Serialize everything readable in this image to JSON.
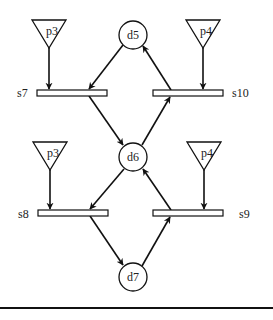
{
  "diagram": {
    "type": "petri-net",
    "places": [
      {
        "id": "d5",
        "label": "d5",
        "cx": 133,
        "cy": 35,
        "r": 14
      },
      {
        "id": "d6",
        "label": "d6",
        "cx": 133,
        "cy": 157,
        "r": 14
      },
      {
        "id": "d7",
        "label": "d7",
        "cx": 133,
        "cy": 277,
        "r": 14
      }
    ],
    "transitions": [
      {
        "id": "s7",
        "label": "s7",
        "x": 37,
        "y": 90,
        "w": 70,
        "h": 6,
        "label_x": 17,
        "label_y": 97
      },
      {
        "id": "s10",
        "label": "s10",
        "x": 153,
        "y": 90,
        "w": 70,
        "h": 6,
        "label_x": 232,
        "label_y": 97
      },
      {
        "id": "s8",
        "label": "s8",
        "x": 38,
        "y": 210,
        "w": 70,
        "h": 6,
        "label_x": 18,
        "label_y": 218
      },
      {
        "id": "s9",
        "label": "s9",
        "x": 153,
        "y": 210,
        "w": 70,
        "h": 6,
        "label_x": 239,
        "label_y": 218
      }
    ],
    "sources": [
      {
        "id": "p3-top",
        "label": "p3",
        "points": "32,20 66,20 49,48",
        "label_x": 52,
        "label_y": 31
      },
      {
        "id": "p4-top",
        "label": "p4",
        "points": "186,20 220,20 203,48",
        "label_x": 206,
        "label_y": 31
      },
      {
        "id": "p3-bottom",
        "label": "p3",
        "points": "33,142 67,142 50,170",
        "label_x": 53,
        "label_y": 153
      },
      {
        "id": "p4-bottom",
        "label": "p4",
        "points": "187,142 221,142 204,170",
        "label_x": 207,
        "label_y": 153
      }
    ],
    "arcs": [
      {
        "from": "p3-top",
        "to": "s7",
        "x1": 49,
        "y1": 48,
        "x2": 49,
        "y2": 89
      },
      {
        "from": "d5",
        "to": "s7",
        "x1": 123,
        "y1": 45,
        "x2": 89,
        "y2": 89
      },
      {
        "from": "s7",
        "to": "d6",
        "x1": 89,
        "y1": 96,
        "x2": 123,
        "y2": 145
      },
      {
        "from": "p4-top",
        "to": "s10",
        "x1": 203,
        "y1": 48,
        "x2": 203,
        "y2": 89
      },
      {
        "from": "s10",
        "to": "d5",
        "x1": 171,
        "y1": 90,
        "x2": 143,
        "y2": 46
      },
      {
        "from": "d6",
        "to": "s10",
        "x1": 142,
        "y1": 145,
        "x2": 170,
        "y2": 97
      },
      {
        "from": "p3-bottom",
        "to": "s8",
        "x1": 50,
        "y1": 170,
        "x2": 50,
        "y2": 209
      },
      {
        "from": "d6",
        "to": "s8",
        "x1": 124,
        "y1": 169,
        "x2": 90,
        "y2": 209
      },
      {
        "from": "s8",
        "to": "d7",
        "x1": 90,
        "y1": 216,
        "x2": 123,
        "y2": 265
      },
      {
        "from": "p4-bottom",
        "to": "s9",
        "x1": 204,
        "y1": 170,
        "x2": 204,
        "y2": 209
      },
      {
        "from": "s9",
        "to": "d6",
        "x1": 171,
        "y1": 210,
        "x2": 143,
        "y2": 169
      },
      {
        "from": "d7",
        "to": "s9",
        "x1": 142,
        "y1": 266,
        "x2": 170,
        "y2": 217
      }
    ],
    "colors": {
      "stroke": "#111111",
      "fill": "#ffffff",
      "text": "#222222"
    }
  }
}
